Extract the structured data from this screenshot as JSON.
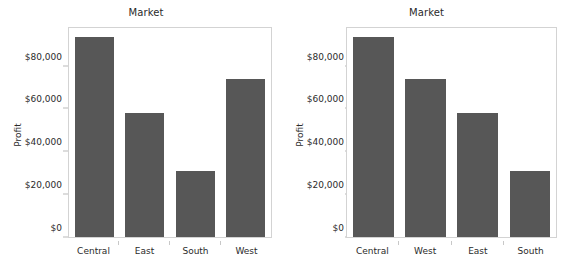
{
  "chart_data": [
    {
      "type": "bar",
      "title": "Market",
      "xlabel": "",
      "ylabel": "Profit",
      "categories": [
        "Central",
        "East",
        "South",
        "West"
      ],
      "values": [
        94500,
        58500,
        31000,
        74400
      ],
      "ytick_labels": [
        "$0",
        "$20,000",
        "$40,000",
        "$60,000",
        "$80,000"
      ],
      "ytick_values": [
        0,
        20000,
        40000,
        60000,
        80000
      ],
      "ylim": [
        0,
        98500
      ],
      "grid": false,
      "legend": "none",
      "bar_color": "#575757",
      "sort": "alphabetical"
    },
    {
      "type": "bar",
      "title": "Market",
      "xlabel": "",
      "ylabel": "Profit",
      "categories": [
        "Central",
        "West",
        "East",
        "South"
      ],
      "values": [
        94500,
        74400,
        58500,
        31000
      ],
      "ytick_labels": [
        "$0",
        "$20,000",
        "$40,000",
        "$60,000",
        "$80,000"
      ],
      "ytick_values": [
        0,
        20000,
        40000,
        60000,
        80000
      ],
      "ylim": [
        0,
        98500
      ],
      "grid": false,
      "legend": "none",
      "bar_color": "#575757",
      "sort": "descending-by-value"
    }
  ],
  "colors": {
    "bar": "#575757",
    "frame": "#d3d3d3",
    "text": "#2b2b2b",
    "background": "#ffffff"
  }
}
